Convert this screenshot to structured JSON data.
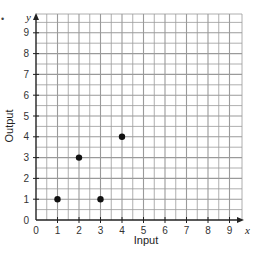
{
  "bullet": "•",
  "chart_data": {
    "type": "scatter",
    "title": "",
    "xlabel": "Input",
    "ylabel": "Output",
    "x_axis_var": "x",
    "y_axis_var": "y",
    "xlim": [
      0,
      9
    ],
    "ylim": [
      0,
      9
    ],
    "x_ticks": [
      0,
      1,
      2,
      3,
      4,
      5,
      6,
      7,
      8,
      9
    ],
    "y_ticks": [
      0,
      1,
      2,
      3,
      4,
      5,
      6,
      7,
      8,
      9
    ],
    "grid": true,
    "grid_minor_step": 0.5,
    "legend": null,
    "series": [
      {
        "name": "points",
        "points": [
          {
            "x": 1,
            "y": 1
          },
          {
            "x": 2,
            "y": 3
          },
          {
            "x": 3,
            "y": 1
          },
          {
            "x": 4,
            "y": 4
          }
        ]
      }
    ]
  },
  "colors": {
    "grid": "#9a9a9a",
    "axis": "#222222",
    "point": "#111111",
    "background": "#ffffff"
  }
}
